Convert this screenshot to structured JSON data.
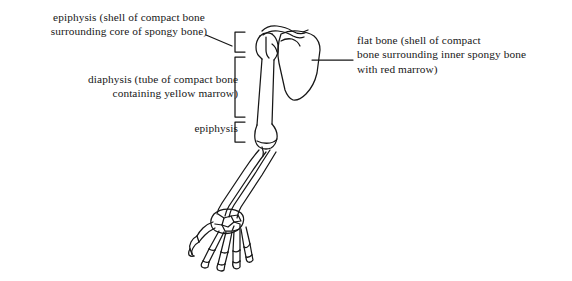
{
  "figure": {
    "background_color": "#ffffff",
    "ink_color": "#171717"
  },
  "labels": {
    "epiphysis_top": "epiphysis (shell of compact bone\nsurrounding core of spongy bone)",
    "diaphysis": "diaphysis (tube of compact bone\ncontaining yellow marrow)",
    "epiphysis_bottom": "epiphysis",
    "flat_bone": "flat bone (shell of compact\nbone surrounding inner spongy bone\nwith red marrow)"
  },
  "brackets": [
    {
      "name": "epiphysis-top-bracket",
      "region": "proximal humerus epiphysis"
    },
    {
      "name": "diaphysis-bracket",
      "region": "humerus shaft"
    },
    {
      "name": "epiphysis-bottom-bracket",
      "region": "distal humerus epiphysis"
    }
  ],
  "leader_lines": [
    {
      "name": "epiphysis-top-leader",
      "from": "epiphysis top label",
      "to": "top bracket"
    },
    {
      "name": "flat-bone-leader",
      "from": "scapula",
      "to": "flat bone label"
    }
  ],
  "anatomy": {
    "parts": [
      "clavicle",
      "scapula",
      "humerus head",
      "humerus shaft",
      "humerus distal end",
      "radius",
      "ulna",
      "carpals",
      "metacarpals",
      "phalanges"
    ]
  }
}
